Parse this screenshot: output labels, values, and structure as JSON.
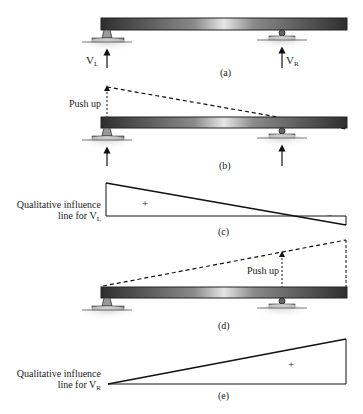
{
  "panels": {
    "a": {
      "caption": "(a)",
      "left_reaction": "V",
      "left_reaction_sub": "L",
      "right_reaction": "V",
      "right_reaction_sub": "R"
    },
    "b": {
      "caption": "(b)",
      "push_label": "Push up"
    },
    "c": {
      "caption": "(c)",
      "label_line1": "Qualitative influence",
      "label_line2": "line for V",
      "label_sub": "L",
      "positive_sign": "+",
      "negative_sign": "−"
    },
    "d": {
      "caption": "(d)",
      "push_label": "Push up"
    },
    "e": {
      "caption": "(e)",
      "label_line1": "Qualitative influence",
      "label_line2": "line for V",
      "label_sub": "R",
      "positive_sign": "+"
    }
  },
  "colors": {
    "beam_dark": "#2a2a2a",
    "beam_light": "#d8d8d8",
    "ground": "#b8b8b8",
    "line": "#111111"
  }
}
